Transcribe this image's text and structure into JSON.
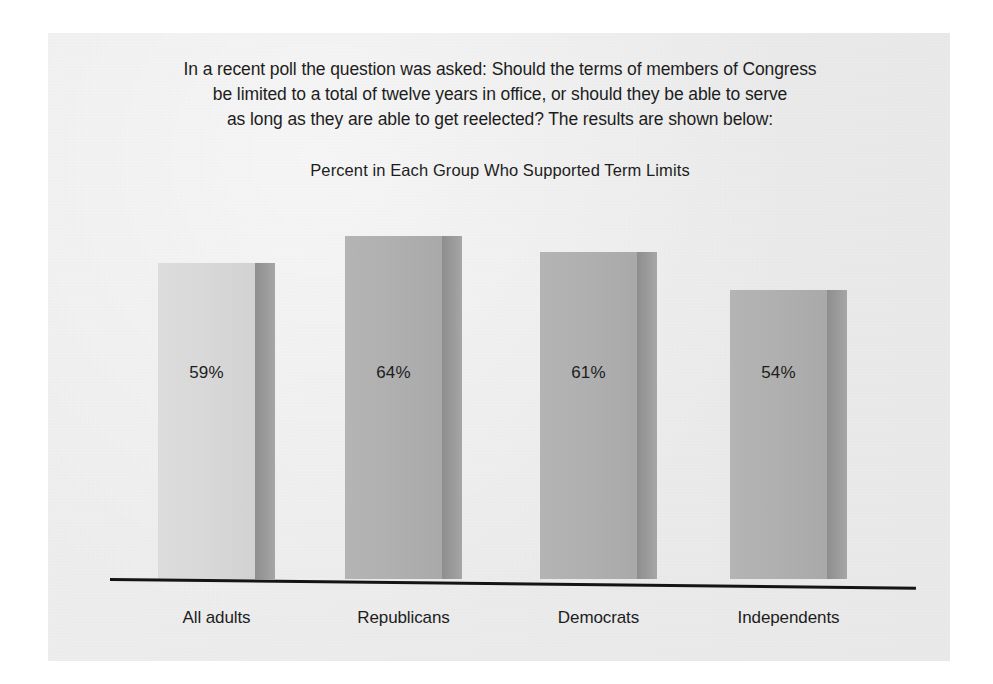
{
  "page": {
    "background_color": "#ffffff",
    "sheet_color": "#ececec"
  },
  "intro": {
    "line1": "In a recent poll the question was asked: Should the terms of members of Congress",
    "line2": "be limited to a total of twelve years in office, or should they be able to serve",
    "line3": "as long as they are able to get reelected? The results are shown below:"
  },
  "chart_data": {
    "type": "bar",
    "title": "Percent in Each Group Who Supported Term Limits",
    "xlabel": "",
    "ylabel": "",
    "ylim": [
      0,
      100
    ],
    "grid": false,
    "legend": "none",
    "orientation": "vertical",
    "value_labels_inside_bars": true,
    "categories": [
      "All adults",
      "Republicans",
      "Democrats",
      "Independents"
    ],
    "values": [
      59,
      64,
      61,
      54
    ],
    "value_labels": [
      "59%",
      "64%",
      "61%",
      "54%"
    ],
    "bar_colors": [
      "#d9d9d9",
      "#b0b0b0",
      "#b0b0b0",
      "#b0b0b0"
    ],
    "bar_side_color": "#949494",
    "axis_color": "#141414",
    "text_color": "#1d1d1d"
  }
}
